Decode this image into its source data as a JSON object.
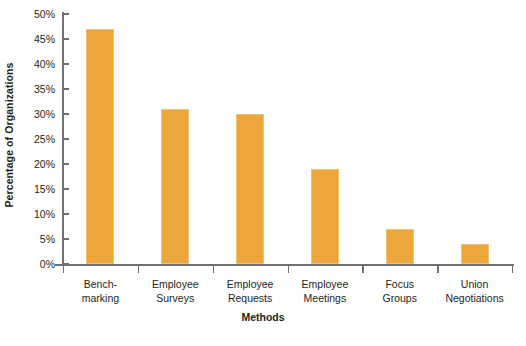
{
  "chart_data": {
    "type": "bar",
    "title": "",
    "subtitle": "",
    "xlabel": "Methods",
    "ylabel": "Percentage of Organizations",
    "categories": [
      "Bench-\nmarking",
      "Employee\nSurveys",
      "Employee\nRequests",
      "Employee\nMeetings",
      "Focus\nGroups",
      "Union\nNegotiations"
    ],
    "category_lines": [
      [
        "Bench-",
        "marking"
      ],
      [
        "Employee",
        "Surveys"
      ],
      [
        "Employee",
        "Requests"
      ],
      [
        "Employee",
        "Meetings"
      ],
      [
        "Focus",
        "Groups"
      ],
      [
        "Union",
        "Negotiations"
      ]
    ],
    "values": [
      47,
      31,
      30,
      19,
      7,
      4
    ],
    "ylim": [
      0,
      50
    ],
    "ytick_values": [
      0,
      5,
      10,
      15,
      20,
      25,
      30,
      35,
      40,
      45,
      50
    ],
    "ytick_labels": [
      "0%",
      "5%",
      "10%",
      "15%",
      "20%",
      "25%",
      "30%",
      "35%",
      "40%",
      "45%",
      "50%"
    ],
    "grid": false,
    "legend": "none",
    "bar_color": "#eda63c",
    "bar_edge_color": "#f3c273",
    "axis_color": "#6f7072",
    "text_color": "#231f20",
    "background": "#ffffff"
  },
  "axis_titles": {
    "y": "Percentage of Organizations",
    "x": "Methods"
  }
}
